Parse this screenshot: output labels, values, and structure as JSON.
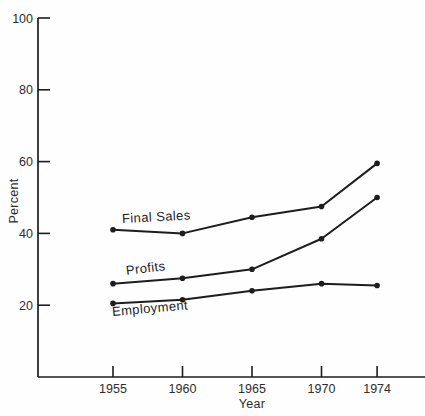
{
  "figure": {
    "background": "#fffefe",
    "ink_color": "#1d1d1d",
    "text_color": "#2d2d2d"
  },
  "chart_data": {
    "type": "line",
    "title": "",
    "xlabel": "Year",
    "ylabel": "Percent",
    "x": [
      1955,
      1960,
      1965,
      1970,
      1974
    ],
    "x_tick_labels": [
      "1955",
      "1960",
      "1965",
      "1970",
      "1974"
    ],
    "y_ticks": [
      20,
      40,
      60,
      80,
      100
    ],
    "y_tick_labels": [
      "20",
      "40",
      "60",
      "80",
      "100"
    ],
    "ylim": [
      0,
      100
    ],
    "xlim": [
      1949.6,
      1977.8
    ],
    "grid": false,
    "legend": "inline-series-labels",
    "marker": "filled-circle",
    "line_color": "#1d1d1d",
    "series": [
      {
        "name": "Final Sales",
        "values": [
          41,
          40,
          44.5,
          47.5,
          59.5
        ]
      },
      {
        "name": "Profits",
        "values": [
          26,
          27.5,
          30,
          38.5,
          50
        ]
      },
      {
        "name": "Employment",
        "values": [
          20.5,
          21.5,
          24,
          26,
          25.5
        ]
      }
    ],
    "series_label_layout": [
      {
        "left": 122,
        "top": 211,
        "rotation_deg": -3
      },
      {
        "left": 126,
        "top": 263,
        "rotation_deg": -7
      },
      {
        "left": 112,
        "top": 304,
        "rotation_deg": -5
      }
    ]
  }
}
